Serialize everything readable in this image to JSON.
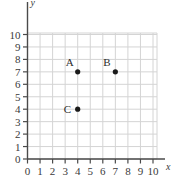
{
  "chart_data": {
    "type": "scatter",
    "title": "",
    "xlabel": "x",
    "ylabel": "y",
    "xlim": [
      0,
      10
    ],
    "ylim": [
      0,
      10
    ],
    "grid": true,
    "legend": "none",
    "x_ticks": [
      "0",
      "1",
      "2",
      "3",
      "4",
      "5",
      "6",
      "7",
      "8",
      "9",
      "10"
    ],
    "y_ticks": [
      "0",
      "1",
      "2",
      "3",
      "4",
      "5",
      "6",
      "7",
      "8",
      "9",
      "10"
    ],
    "points": [
      {
        "label": "A",
        "x": 4,
        "y": 7,
        "label_position": "upper-left"
      },
      {
        "label": "B",
        "x": 7,
        "y": 7,
        "label_position": "upper-left"
      },
      {
        "label": "C",
        "x": 4,
        "y": 4,
        "label_position": "left"
      }
    ]
  },
  "style": {
    "grid_color": "#d4d4d4",
    "axis_color": "#4a4a4a",
    "point_color": "#1a1a1a",
    "text_color": "#3a3a3a",
    "background": "#ffffff"
  }
}
